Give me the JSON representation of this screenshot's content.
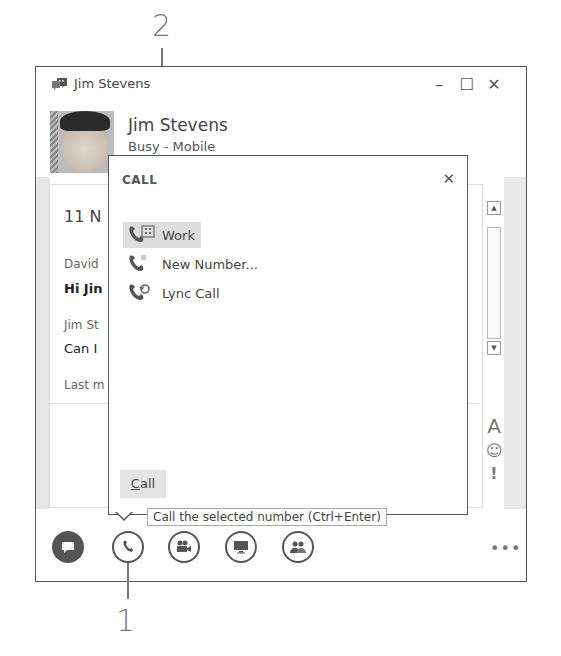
{
  "callouts": {
    "top_number": "2",
    "bottom_number": "1"
  },
  "window": {
    "title": "Jim Stevens",
    "controls": {
      "minimize": "–",
      "maximize": "☐",
      "close": "✕"
    }
  },
  "contact": {
    "name": "Jim Stevens",
    "status": "Busy - Mobile"
  },
  "conversation": {
    "date": "11 N",
    "messages": [
      {
        "sender": "David",
        "text": "Hi Jin"
      },
      {
        "sender": "Jim St",
        "text": "Can I"
      }
    ],
    "last_message": "Last m"
  },
  "call_popup": {
    "title": "CALL",
    "close": "✕",
    "items": [
      {
        "label": "Work",
        "icon": "phone-work-icon",
        "selected": true
      },
      {
        "label": "New Number...",
        "icon": "phone-new-number-icon",
        "selected": false
      },
      {
        "label": "Lync Call",
        "icon": "phone-lync-icon",
        "selected": false
      }
    ],
    "call_button_underlined": "C",
    "call_button_rest": "all"
  },
  "tooltip": {
    "text": "Call the selected number (Ctrl+Enter)"
  },
  "format_tools": {
    "font": "A",
    "emoticon": "☺",
    "priority": "!"
  },
  "actions": [
    {
      "name": "im-button",
      "icon": "chat-bubble-icon"
    },
    {
      "name": "call-button",
      "icon": "phone-icon"
    },
    {
      "name": "video-button",
      "icon": "video-camera-icon"
    },
    {
      "name": "present-button",
      "icon": "monitor-icon"
    },
    {
      "name": "participants-button",
      "icon": "people-icon"
    }
  ],
  "more_options": "•••",
  "colors": {
    "border": "#555555",
    "selected_bg": "#dddddd",
    "button_bg": "#e4e4e4",
    "callout": "#777777"
  }
}
